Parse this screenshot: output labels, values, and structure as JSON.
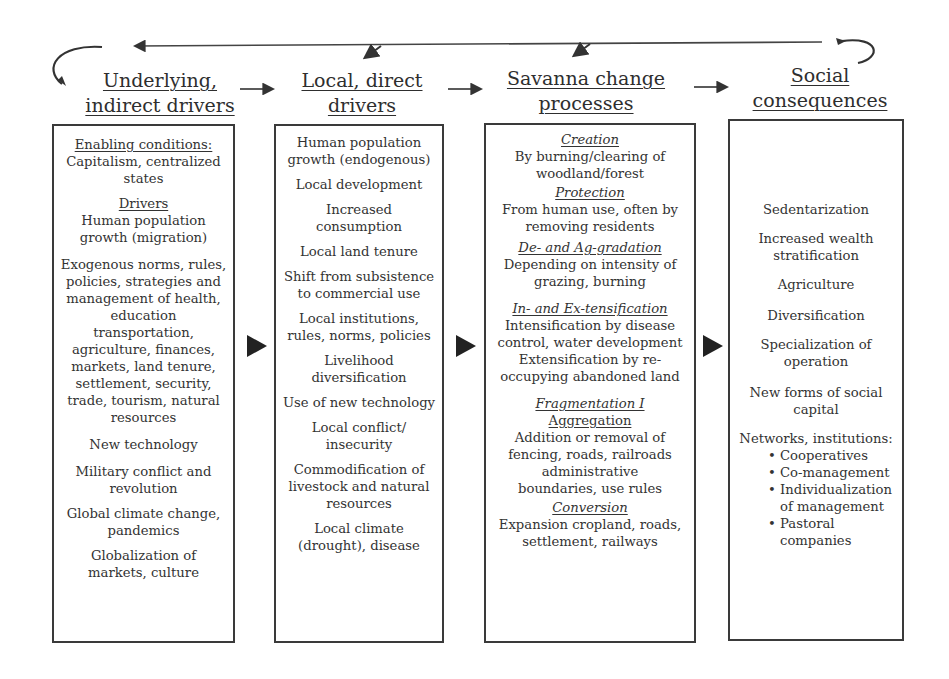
{
  "headers": [
    {
      "line1": "Underlying,",
      "line2": "indirect drivers"
    },
    {
      "line1": "Local, direct",
      "line2": "drivers"
    },
    {
      "line1": "Savanna change",
      "line2": "processes"
    },
    {
      "line1": "Social",
      "line2": "consequences"
    }
  ],
  "columns": {
    "underlying": {
      "enabling_heading": "Enabling conditions:",
      "enabling_text": "Capitalism, centralized states",
      "drivers_heading": "Drivers",
      "items": [
        "Human population growth (migration)",
        "Exogenous norms, rules, policies, strategies and management of health, education transportation, agriculture, finances, markets, land tenure, settlement, security, trade, tourism, natural resources",
        "New technology",
        "Military conflict and revolution",
        "Global climate change, pandemics",
        "Globalization of markets, culture"
      ]
    },
    "local": {
      "items": [
        "Human population growth (endogenous)",
        "Local development",
        "Increased consumption",
        "Local land tenure",
        "Shift from subsistence to commercial use",
        "Local institutions, rules, norms, policies",
        "Livelihood diversification",
        "Use of new technology",
        "Local conflict/ insecurity",
        "Commodification of livestock and natural resources",
        "Local climate (drought), disease"
      ]
    },
    "savanna": {
      "sections": [
        {
          "title": "Creation",
          "text": "By burning/clearing of woodland/forest"
        },
        {
          "title": "Protection",
          "text": "From human use, often by removing residents"
        },
        {
          "title": "De- and Ag-gradation",
          "text": "Depending on intensity of grazing, burning"
        },
        {
          "title": "In- and Ex-tensification",
          "text": "Intensification by disease control, water development Extensification by re-occupying abandoned land"
        },
        {
          "title": "Fragmentation I",
          "subtitle": "Aggregation",
          "text": "Addition or removal of fencing, roads, railroads administrative boundaries, use rules"
        },
        {
          "title": "Conversion",
          "text": "Expansion cropland, roads, settlement, railways"
        }
      ]
    },
    "social": {
      "items": [
        "Sedentarization",
        "Increased wealth stratification",
        "Agriculture",
        "Diversification",
        "Specialization of operation",
        "New forms of social capital"
      ],
      "networks_heading": "Networks, institutions:",
      "bullets": [
        "Cooperatives",
        "Co-management",
        "Individualization of management",
        "Pastoral companies"
      ]
    }
  }
}
